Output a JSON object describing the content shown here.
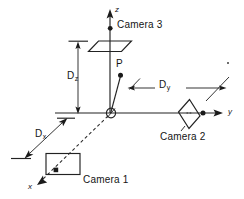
{
  "figure": {
    "type": "diagram",
    "background_color": "#ffffff",
    "ink_color": "#1a1a1a",
    "width": 244,
    "height": 199
  },
  "axes": {
    "z": {
      "label": "z",
      "direction": "up",
      "tip": [
        110,
        10
      ],
      "origin": [
        110,
        113
      ]
    },
    "y": {
      "label": "y",
      "direction": "right",
      "tip": [
        222,
        113
      ],
      "origin": [
        110,
        113
      ]
    },
    "x": {
      "label": "x",
      "direction": "down-left",
      "tip": [
        38,
        184
      ],
      "origin": [
        110,
        113
      ],
      "style": "dashed"
    }
  },
  "origin": {
    "name": "origin-marker",
    "center": [
      111,
      113
    ],
    "radius": 4.4
  },
  "point": {
    "label": "P",
    "dot": [
      120.5,
      75
    ],
    "label_pos": [
      116,
      60
    ]
  },
  "cameras": [
    {
      "id": 1,
      "label": "Camera 1",
      "shape": "rectangle",
      "label_pos": [
        84,
        176
      ],
      "marker": [
        56,
        170
      ]
    },
    {
      "id": 2,
      "label": "Camera 2",
      "shape": "parallelogram-vertical",
      "label_pos": [
        161,
        133
      ],
      "marker": [
        203,
        113
      ]
    },
    {
      "id": 3,
      "label": "Camera 3",
      "shape": "parallelogram-horizontal",
      "label_pos": [
        117,
        21
      ],
      "marker": [
        110,
        28
      ]
    }
  ],
  "dimensions": [
    {
      "name": "Dz",
      "base": "D",
      "subscript": "z",
      "orientation": "vertical",
      "from": [
        78,
        42
      ],
      "to": [
        78,
        113
      ],
      "label_pos": [
        68,
        72
      ]
    },
    {
      "name": "Dy",
      "base": "D",
      "subscript": "y",
      "orientation": "horizontal",
      "from": [
        128,
        88
      ],
      "to": [
        226,
        88
      ],
      "label_pos": [
        160,
        80
      ]
    },
    {
      "name": "Dx",
      "base": "D",
      "subscript": "x",
      "orientation": "diagonal",
      "from": [
        25,
        158
      ],
      "to": [
        67,
        118
      ],
      "label_pos": [
        36,
        129
      ]
    }
  ]
}
